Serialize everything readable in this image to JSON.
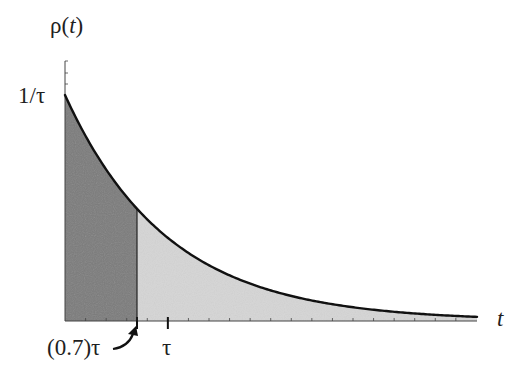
{
  "chart_data": {
    "type": "area",
    "title": "",
    "function": "rho(t) = (1/tau) * exp(-t/tau)",
    "xlabel": "t",
    "ylabel": "ρ(t)",
    "y_tick_labels": [
      "1/τ"
    ],
    "x_tick_labels": [
      "(0.7)τ",
      "τ"
    ],
    "annotations": [
      {
        "text": "(0.7)τ",
        "arrow_to": "x = 0.7τ",
        "style": "curved arrow"
      }
    ],
    "regions": [
      {
        "name": "dark-shaded",
        "from": 0,
        "to": 0.7,
        "color": "#7a7a7a"
      },
      {
        "name": "light-shaded",
        "from": 0.7,
        "to": 3.0,
        "color": "#d6d6d6"
      }
    ],
    "x_units": "τ",
    "y_units": "1/τ",
    "xlim": [
      0,
      3.0
    ],
    "ylim": [
      0,
      1.15
    ],
    "x": [
      0,
      0.1,
      0.2,
      0.3,
      0.4,
      0.5,
      0.6,
      0.7,
      0.8,
      0.9,
      1.0,
      1.2,
      1.4,
      1.6,
      1.8,
      2.0,
      2.2,
      2.4,
      2.6,
      2.8,
      3.0
    ],
    "values": [
      1.0,
      0.905,
      0.819,
      0.741,
      0.67,
      0.607,
      0.549,
      0.497,
      0.449,
      0.407,
      0.368,
      0.301,
      0.247,
      0.202,
      0.165,
      0.135,
      0.111,
      0.091,
      0.074,
      0.061,
      0.05
    ],
    "grid": false,
    "legend": null,
    "x_minor_tick_step": 0.2,
    "y_minor_tick_step": 0.05
  },
  "labels": {
    "ylabel_main": "ρ(",
    "ylabel_var": "t",
    "ylabel_close": ")",
    "ytick": "1/τ",
    "xlabel": "t",
    "xtick_07": "(0.7)τ",
    "xtick_tau": "τ"
  },
  "colors": {
    "curve": "#111111",
    "dark_fill": "#7a7a7a",
    "light_fill": "#d6d6d6",
    "axis": "#444444"
  }
}
